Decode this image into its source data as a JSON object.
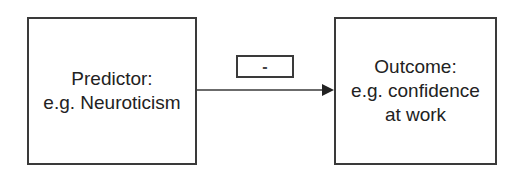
{
  "diagram": {
    "predictor": {
      "lines": [
        "Predictor:",
        "e.g. Neuroticism"
      ]
    },
    "outcome": {
      "lines": [
        "Outcome:",
        "e.g. confidence",
        "at work"
      ]
    },
    "relation": {
      "sign": "-"
    },
    "colors": {
      "stroke": "#3a3a3a",
      "text": "#222222",
      "background": "#ffffff"
    }
  }
}
